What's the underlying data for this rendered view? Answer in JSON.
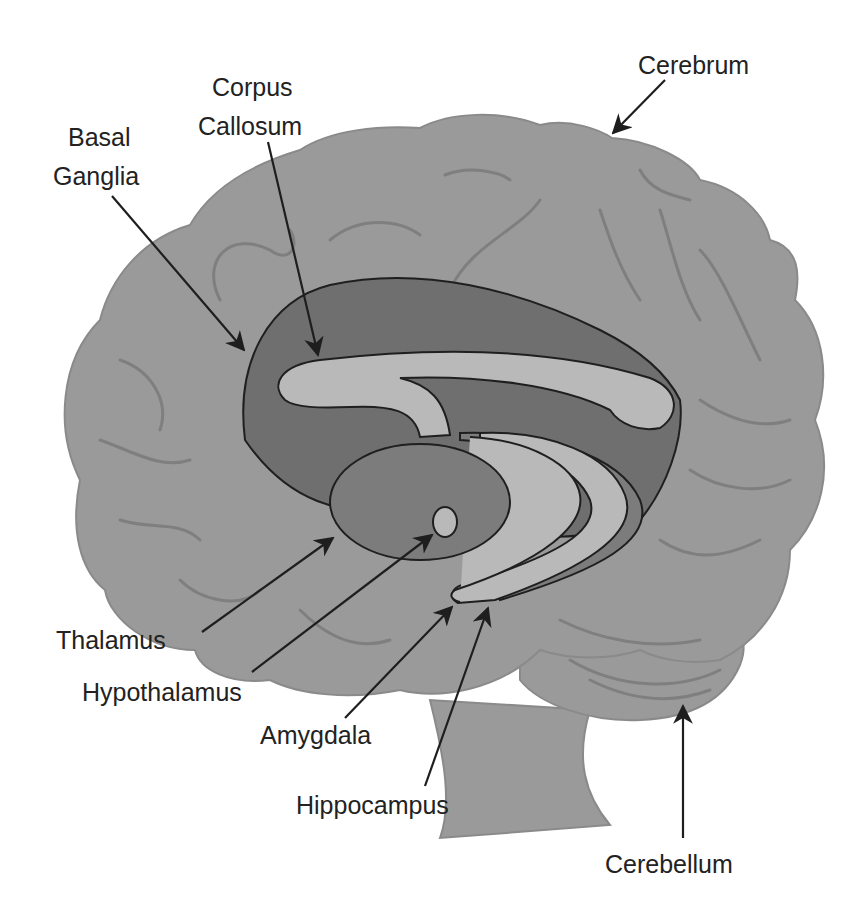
{
  "figure": {
    "labels": {
      "cerebrum": "Cerebrum",
      "corpus_callosum_line1": "Corpus",
      "corpus_callosum_line2": "Callosum",
      "basal_ganglia_line1": "Basal",
      "basal_ganglia_line2": "Ganglia",
      "thalamus": "Thalamus",
      "hypothalamus": "Hypothalamus",
      "amygdala": "Amygdala",
      "hippocampus": "Hippocampus",
      "cerebellum": "Cerebellum"
    },
    "colors": {
      "background": "#ffffff",
      "cortex": "#9a9a9a",
      "gyri": "#7f7f7f",
      "basal_ganglia": "#6f6f6f",
      "corpus_callosum": "#b9b9b9",
      "thalamus": "#7c7c7c",
      "outline": "#1f1f1f",
      "text": "#222222"
    }
  }
}
